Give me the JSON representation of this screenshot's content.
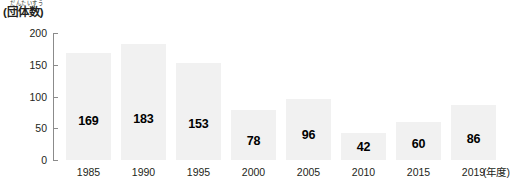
{
  "chart_data": {
    "type": "bar",
    "title": "",
    "subtitle": "",
    "xlabel": "(年度)",
    "ylabel": "(団体数)",
    "ylabel_furigana": "だんたいすう",
    "categories": [
      "1985",
      "1990",
      "1995",
      "2000",
      "2005",
      "2010",
      "2015",
      "2019"
    ],
    "values": [
      169,
      183,
      153,
      78,
      96,
      42,
      60,
      86
    ],
    "value_labels": [
      "169",
      "183",
      "153",
      "78",
      "96",
      "42",
      "60",
      "86"
    ],
    "ylim": [
      0,
      200
    ],
    "ytick_labels": [
      "0",
      "50",
      "100",
      "150",
      "200"
    ],
    "ytick_values": [
      0,
      50,
      100,
      150,
      200
    ],
    "grid": false,
    "legend": null,
    "bar_color": "#f1f1f1",
    "axis_color": "#8b8b8b",
    "text_color": "#231f20",
    "value_label_color": "#000000"
  }
}
